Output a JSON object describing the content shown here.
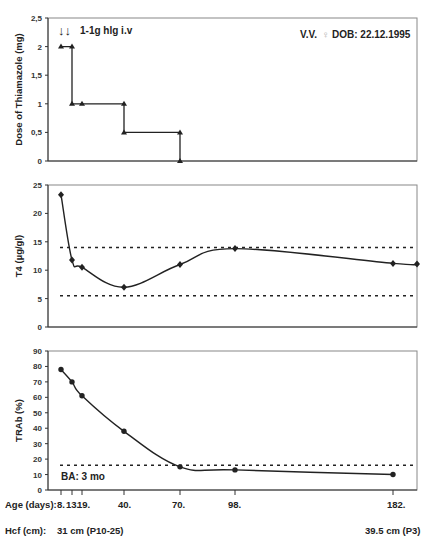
{
  "header": {
    "patient": "V.V.",
    "sex_symbol": "♀",
    "dob": "DOB: 22.12.1995",
    "treatment_note": "1-1g hlg i.v",
    "treatment_arrows": "↓↓"
  },
  "x_axis": {
    "label": "Age (days):",
    "ticks": [
      "8.",
      "13.",
      "19.",
      "40.",
      "70.",
      "98.",
      "182."
    ],
    "tick_values": [
      8,
      13,
      19,
      40,
      70,
      98,
      182
    ]
  },
  "hcf": {
    "label": "Hcf (cm):",
    "start": "31 cm (P10-25)",
    "end": "39.5 cm (P3)"
  },
  "bone_age": "BA: 3 mo",
  "chart_data": [
    {
      "type": "line",
      "title": "",
      "ylabel": "Dose of Thiamazole (mg)",
      "xlabel": "Age (days)",
      "ylim": [
        0,
        2.5
      ],
      "yticks": [
        "0",
        "0,5",
        "1",
        "1,5",
        "2",
        "2,5"
      ],
      "step": true,
      "marker": "triangle",
      "x": [
        8,
        13,
        13,
        19,
        40,
        40,
        70,
        70
      ],
      "values": [
        2,
        2,
        1,
        1,
        1,
        0.5,
        0.5,
        0
      ],
      "grid": false
    },
    {
      "type": "line",
      "title": "",
      "ylabel": "T4 (µg/gl)",
      "xlabel": "Age (days)",
      "ylim": [
        0,
        25
      ],
      "yticks": [
        "0",
        "5",
        "10",
        "15",
        "20",
        "25"
      ],
      "marker": "diamond",
      "x": [
        8,
        13,
        19,
        40,
        70,
        98,
        182,
        200
      ],
      "values": [
        23.3,
        11.8,
        10.5,
        7.0,
        11.0,
        13.8,
        11.2,
        11.1
      ],
      "reference_lines": [
        14.0,
        5.5
      ],
      "grid": false
    },
    {
      "type": "line",
      "title": "",
      "ylabel": "TRAb (%)",
      "xlabel": "Age (days)",
      "ylim": [
        0,
        90
      ],
      "yticks": [
        "0",
        "10",
        "20",
        "30",
        "40",
        "50",
        "60",
        "70",
        "80",
        "90"
      ],
      "marker": "circle",
      "x": [
        8,
        13,
        19,
        40,
        70,
        98,
        182
      ],
      "values": [
        78,
        70,
        61,
        38,
        15,
        13,
        10
      ],
      "reference_lines": [
        16
      ],
      "grid": false
    }
  ]
}
